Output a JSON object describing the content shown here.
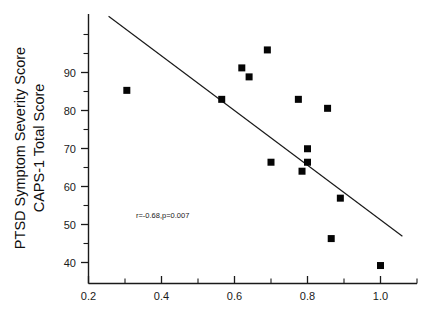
{
  "chart_data": {
    "type": "scatter",
    "title": "",
    "xlabel": "",
    "ylabel": "PTSD Symptom Severity Score CAPS-1 Total Score",
    "ylabel_line1": "PTSD Symptom Severity Score",
    "ylabel_line2": "CAPS-1 Total Score",
    "xlim": [
      0.2,
      1.1
    ],
    "ylim": [
      36,
      96
    ],
    "grid": false,
    "legend": null,
    "xticks": [
      0.2,
      0.4,
      0.6,
      0.8,
      1.0
    ],
    "xtick_labels": [
      "0.2",
      "0.4",
      "0.6",
      "0.8",
      "1.0"
    ],
    "xminor_ticks": [
      0.3,
      0.5,
      0.7,
      0.9,
      1.1
    ],
    "yticks": [
      40,
      50,
      60,
      70,
      80,
      90
    ],
    "ytick_labels": [
      "40",
      "50",
      "60",
      "70",
      "80",
      "90"
    ],
    "yminor_ticks": [
      45,
      55,
      65,
      75,
      85,
      95
    ],
    "points": [
      {
        "x": 0.305,
        "y": 79
      },
      {
        "x": 0.565,
        "y": 77
      },
      {
        "x": 0.62,
        "y": 84
      },
      {
        "x": 0.64,
        "y": 82
      },
      {
        "x": 0.69,
        "y": 88
      },
      {
        "x": 0.7,
        "y": 63
      },
      {
        "x": 0.775,
        "y": 77
      },
      {
        "x": 0.785,
        "y": 61
      },
      {
        "x": 0.8,
        "y": 66
      },
      {
        "x": 0.8,
        "y": 63
      },
      {
        "x": 0.855,
        "y": 75
      },
      {
        "x": 0.865,
        "y": 46
      },
      {
        "x": 0.89,
        "y": 55
      },
      {
        "x": 1.0,
        "y": 40
      }
    ],
    "fit_line": {
      "x_start": 0.255,
      "y_start": 95.5,
      "x_end": 1.06,
      "y_end": 46.5
    },
    "annotation": {
      "text": "r=-0.68,p=0.007",
      "x": 0.33,
      "y": 50.5
    },
    "statistics": {
      "r": -0.68,
      "p": 0.007,
      "n": 14
    },
    "marker_style": "filled-square",
    "marker_color": "#050505"
  },
  "colors": {
    "axis": "#1a1a1a",
    "marker": "#050505",
    "line": "#1a1a1a",
    "background": "#ffffff"
  }
}
